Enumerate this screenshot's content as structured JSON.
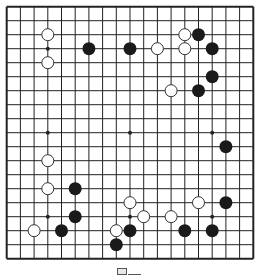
{
  "board": {
    "size": 19,
    "origin_x": 6.7,
    "origin_y": 6.7,
    "spacing_x": 13.7,
    "spacing_y": 14.0,
    "stone_radius": 6.5,
    "line_color": "#222222",
    "background": "#ffffff",
    "black_color": "#1a1a1a",
    "white_fill": "#ffffff",
    "white_stroke": "#333333",
    "star_points": [
      [
        3,
        3
      ],
      [
        9,
        3
      ],
      [
        15,
        3
      ],
      [
        3,
        9
      ],
      [
        9,
        9
      ],
      [
        15,
        9
      ],
      [
        3,
        15
      ],
      [
        9,
        15
      ],
      [
        15,
        15
      ]
    ],
    "black_stones": [
      [
        6,
        3
      ],
      [
        9,
        3
      ],
      [
        14,
        2
      ],
      [
        15,
        3
      ],
      [
        15,
        5
      ],
      [
        14,
        6
      ],
      [
        16,
        10
      ],
      [
        5,
        13
      ],
      [
        5,
        15
      ],
      [
        4,
        16
      ],
      [
        9,
        16
      ],
      [
        8,
        17
      ],
      [
        13,
        16
      ],
      [
        16,
        14
      ],
      [
        15,
        16
      ]
    ],
    "white_stones": [
      [
        3,
        2
      ],
      [
        3,
        4
      ],
      [
        13,
        2
      ],
      [
        11,
        3
      ],
      [
        13,
        3
      ],
      [
        12,
        6
      ],
      [
        3,
        11
      ],
      [
        3,
        13
      ],
      [
        2,
        16
      ],
      [
        8,
        16
      ],
      [
        9,
        14
      ],
      [
        10,
        15
      ],
      [
        12,
        15
      ],
      [
        14,
        14
      ]
    ]
  },
  "caption": {
    "icon": "diagram-label-icon"
  }
}
